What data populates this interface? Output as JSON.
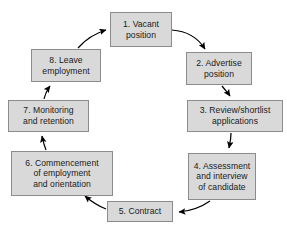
{
  "diagram": {
    "type": "cycle-flow-diagram",
    "direction": "clockwise",
    "colors": {
      "node_fill": "#d9d9d9",
      "node_border": "#8c8c8c",
      "arrow": "#000000",
      "background": "#ffffff",
      "text": "#1a1a1a"
    },
    "nodes": [
      {
        "id": "1",
        "label": "1. Vacant\nposition",
        "line1": "1. Vacant",
        "line2": "position",
        "line3": ""
      },
      {
        "id": "2",
        "label": "2. Advertise\nposition",
        "line1": "2. Advertise",
        "line2": "position",
        "line3": ""
      },
      {
        "id": "3",
        "label": "3. Review/shortlist\napplications",
        "line1": "3. Review/shortlist",
        "line2": "applications",
        "line3": ""
      },
      {
        "id": "4",
        "label": "4. Assessment\nand interview\nof candidate",
        "line1": "4. Assessment",
        "line2": "and interview",
        "line3": "of candidate"
      },
      {
        "id": "5",
        "label": "5. Contract",
        "line1": "5. Contract",
        "line2": "",
        "line3": ""
      },
      {
        "id": "6",
        "label": "6. Commencement\nof employment\nand orientation",
        "line1": "6. Commencement",
        "line2": "of employment",
        "line3": "and orientation"
      },
      {
        "id": "7",
        "label": "7. Monitoring\nand retention",
        "line1": "7. Monitoring",
        "line2": "and retention",
        "line3": ""
      },
      {
        "id": "8",
        "label": "8. Leave\nemployment",
        "line1": "8. Leave",
        "line2": "employment",
        "line3": ""
      }
    ],
    "edges": [
      {
        "from": "1",
        "to": "2"
      },
      {
        "from": "2",
        "to": "3"
      },
      {
        "from": "3",
        "to": "4"
      },
      {
        "from": "4",
        "to": "5"
      },
      {
        "from": "5",
        "to": "6"
      },
      {
        "from": "6",
        "to": "7"
      },
      {
        "from": "7",
        "to": "8"
      },
      {
        "from": "8",
        "to": "1"
      }
    ]
  }
}
